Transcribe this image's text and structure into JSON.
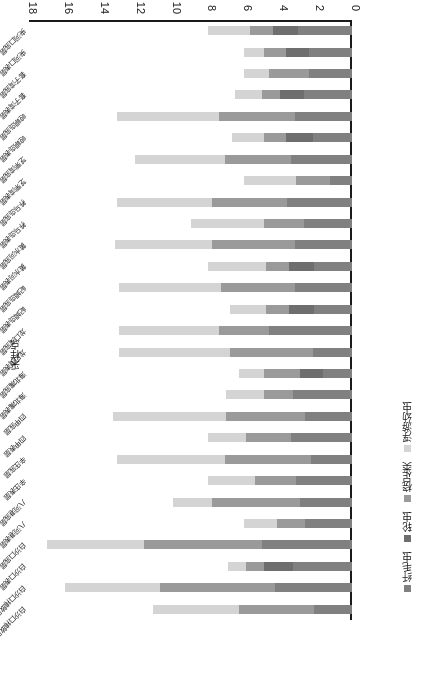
{
  "chart_data": {
    "type": "bar",
    "subtype": "horizontal-stacked",
    "title": "",
    "xlabel": "物种数",
    "ylabel": "采样点",
    "xlim": [
      0,
      18
    ],
    "xticks": [
      "0",
      "2",
      "4",
      "6",
      "8",
      "10",
      "12",
      "14",
      "16",
      "18"
    ],
    "grid": false,
    "legend_position": "left",
    "orientation": "rotated-180",
    "categories": [
      "白沙口排放口表层",
      "白沙口排放口底层",
      "白沙口表层",
      "白沙口底层",
      "八河港表层",
      "八河港底层",
      "辛庄表层",
      "辛庄底层",
      "四甲表层",
      "四甲底层",
      "海北嘴表层",
      "海北嘴底层",
      "龙口湾表层",
      "龙口湾底层",
      "屺姆岛表层",
      "屺姆岛底层",
      "黄水河表层",
      "黄水河底层",
      "养马岛表层",
      "养马岛底层",
      "芝罘湾表层",
      "芝罘湾底层",
      "崆峒岛表层",
      "崆峒岛底层",
      "套子湾表层",
      "套子湾底层",
      "夹河口表层",
      "夹河口底层"
    ],
    "series": [
      {
        "name": "纤毛虫",
        "color": "#808080",
        "values": [
          2.1,
          4.3,
          3.3,
          5.0,
          2.6,
          2.9,
          3.1,
          2.3,
          3.4,
          2.6,
          3.3,
          1.6,
          2.2,
          4.6,
          2.1,
          3.2,
          2.1,
          3.2,
          2.7,
          3.6,
          1.2,
          3.4,
          2.2,
          3.2,
          2.7,
          2.4,
          2.4,
          3.0
        ]
      },
      {
        "name": "轮虫",
        "color": "#6e6e6e",
        "values": [
          0.0,
          0.0,
          1.6,
          0.0,
          0.0,
          0.0,
          0.0,
          0.0,
          0.0,
          0.0,
          0.0,
          1.3,
          0.0,
          0.0,
          1.4,
          0.0,
          1.4,
          0.0,
          0.0,
          0.0,
          0.0,
          0.0,
          1.5,
          0.0,
          1.3,
          0.0,
          1.3,
          1.4
        ]
      },
      {
        "name": "桡足类",
        "color": "#9a9a9a",
        "values": [
          4.2,
          6.4,
          1.0,
          6.6,
          1.6,
          4.9,
          2.3,
          4.8,
          2.5,
          4.4,
          1.6,
          2.0,
          4.6,
          2.8,
          1.3,
          4.1,
          1.3,
          4.6,
          2.2,
          4.2,
          1.9,
          3.7,
          1.2,
          4.2,
          1.0,
          2.2,
          1.2,
          1.3
        ]
      },
      {
        "name": "浮游幼虫",
        "color": "#d4d4d4",
        "values": [
          4.8,
          5.3,
          1.0,
          5.4,
          1.8,
          2.2,
          2.6,
          6.0,
          2.1,
          6.3,
          2.1,
          1.4,
          6.2,
          5.6,
          2.0,
          5.7,
          3.2,
          5.4,
          4.1,
          5.3,
          2.9,
          5.0,
          1.8,
          5.7,
          1.5,
          1.4,
          1.1,
          2.3
        ]
      }
    ]
  },
  "legend": {
    "items": [
      {
        "label": "纤毛虫",
        "color": "#808080"
      },
      {
        "label": "轮虫",
        "color": "#6e6e6e"
      },
      {
        "label": "桡足类",
        "color": "#9a9a9a"
      },
      {
        "label": "浮游幼虫",
        "color": "#d4d4d4"
      }
    ]
  },
  "axes": {
    "value_axis_title": "物种数",
    "category_axis_title": "采样点",
    "value_ticks": [
      "0",
      "2",
      "4",
      "6",
      "8",
      "10",
      "12",
      "14",
      "16",
      "18"
    ]
  },
  "colors": {
    "axis": "#1a1a1a",
    "background": "#ffffff",
    "text": "#1a1a1a"
  }
}
